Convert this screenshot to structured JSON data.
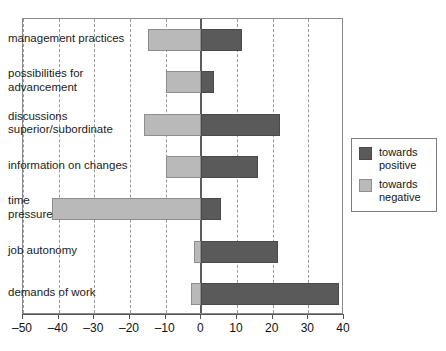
{
  "chart_data": {
    "type": "bar",
    "orientation": "horizontal",
    "title": "",
    "xlabel": "",
    "ylabel": "",
    "xlim": [
      -50,
      40
    ],
    "xticks": [
      -50,
      -40,
      -30,
      -20,
      -10,
      0,
      10,
      20,
      30,
      40
    ],
    "xtick_labels": [
      "–50",
      "–40",
      "–30",
      "–20",
      "–10",
      "0",
      "10",
      "20",
      "30",
      "40"
    ],
    "grid": "vertical-dashed",
    "categories": [
      "management practices",
      "possibilities for\nadvancement",
      "discussions\nsuperior/subordinate",
      "information on changes",
      "time\npressure",
      "job autonomy",
      "demands of work"
    ],
    "series": [
      {
        "name": "towards positive",
        "color": "#5a5a5a",
        "values": [
          11.5,
          3.5,
          22,
          16,
          5.5,
          21.5,
          38.5
        ]
      },
      {
        "name": "towards negative",
        "color": "#b9b9b9",
        "values": [
          -15,
          -10,
          -16,
          -10,
          -42,
          -2,
          -3
        ]
      }
    ],
    "legend": {
      "position": "right",
      "entries": [
        {
          "label": "towards\npositive",
          "color": "#5a5a5a",
          "swatch": "dark-gray-swatch"
        },
        {
          "label": "towards\nnegative",
          "color": "#b9b9b9",
          "swatch": "light-gray-swatch"
        }
      ]
    }
  }
}
